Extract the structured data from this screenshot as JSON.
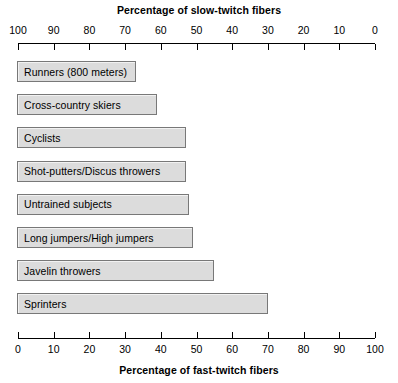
{
  "chart_data": {
    "type": "bar",
    "orientation": "horizontal",
    "title": "",
    "top_axis": {
      "label": "Percentage of slow-twitch fibers",
      "ticks": [
        100,
        90,
        80,
        70,
        60,
        50,
        40,
        30,
        20,
        10,
        0
      ],
      "range": [
        100,
        0
      ],
      "direction": "reversed"
    },
    "bottom_axis": {
      "label": "Percentage of fast-twitch fibers",
      "ticks": [
        0,
        10,
        20,
        30,
        40,
        50,
        60,
        70,
        80,
        90,
        100
      ],
      "range": [
        0,
        100
      ],
      "direction": "normal"
    },
    "xlabel": "Percentage of fast-twitch fibers",
    "ylabel": "",
    "xlim": [
      0,
      100
    ],
    "grid": false,
    "legend": false,
    "categories": [
      "Runners (800 meters)",
      "Cross-country skiers",
      "Cyclists",
      "Shot-putters/Discus throwers",
      "Untrained subjects",
      "Long jumpers/High jumpers",
      "Javelin throwers",
      "Sprinters"
    ],
    "values": [
      33,
      39,
      47,
      47,
      48,
      49,
      55,
      70
    ],
    "series": [
      {
        "name": "Percentage of fast-twitch fibers",
        "values": [
          33,
          39,
          47,
          47,
          48,
          49,
          55,
          70
        ]
      }
    ],
    "bar_fill_color": "#dcdcdc",
    "bar_border_color": "#787878"
  },
  "style": {
    "background": "#ffffff",
    "text_color": "#000000",
    "axis_color": "#000000"
  }
}
